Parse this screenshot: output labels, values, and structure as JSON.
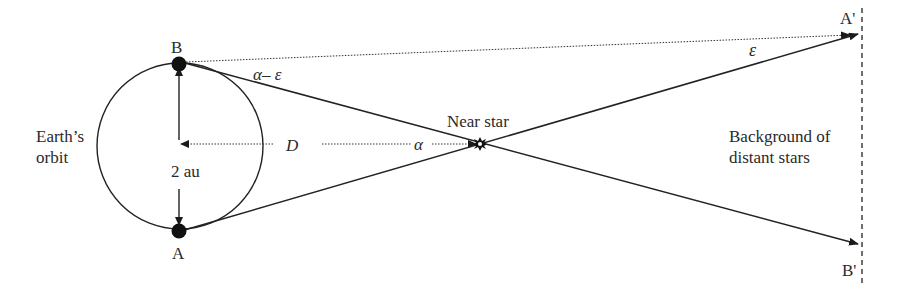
{
  "diagram": {
    "labels": {
      "point_b": "B",
      "point_a": "A",
      "earth_orbit_line1": "Earth’s",
      "earth_orbit_line2": "orbit",
      "baseline": "2 au",
      "distance": "D",
      "alpha_minus_epsilon": "α– ε",
      "alpha": "α",
      "epsilon": "ε",
      "near_star": "Near star",
      "background_line1": "Background of",
      "background_line2": "distant stars",
      "a_prime": "A'",
      "b_prime": "B'"
    },
    "elements": [
      {
        "id": "earth-orbit",
        "type": "circle"
      },
      {
        "id": "position-b",
        "type": "dot"
      },
      {
        "id": "position-a",
        "type": "dot"
      },
      {
        "id": "baseline-arrows",
        "type": "double-arrow"
      },
      {
        "id": "distance-arrow",
        "type": "dotted-arrow"
      },
      {
        "id": "sightline-b",
        "type": "arrow",
        "to": "B'"
      },
      {
        "id": "sightline-a",
        "type": "arrow",
        "to": "A'"
      },
      {
        "id": "reference-line",
        "type": "dotted-line",
        "to": "A'"
      },
      {
        "id": "near-star",
        "type": "star"
      },
      {
        "id": "background-plane",
        "type": "dashed-line"
      }
    ],
    "colors": {
      "stroke": "#222222",
      "text": "#2a2a2a",
      "background": "#ffffff"
    }
  }
}
